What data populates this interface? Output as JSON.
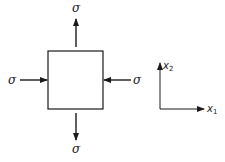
{
  "diagram": {
    "stroke_color": "#1a1a1a",
    "background": "#ffffff",
    "element": {
      "shape": "square",
      "x": 48,
      "y": 51,
      "width": 55,
      "height": 58
    },
    "stress_labels": {
      "top": "σ",
      "bottom": "σ",
      "left": "σ",
      "right": "σ"
    },
    "arrows": [
      {
        "id": "top",
        "direction": "up",
        "type": "tension"
      },
      {
        "id": "bottom",
        "direction": "down",
        "type": "tension"
      },
      {
        "id": "left",
        "direction": "right",
        "type": "compression"
      },
      {
        "id": "right",
        "direction": "left",
        "type": "compression"
      }
    ],
    "axes": {
      "x1_label": "x",
      "x1_subscript": "1",
      "x2_label": "x",
      "x2_subscript": "2"
    }
  }
}
